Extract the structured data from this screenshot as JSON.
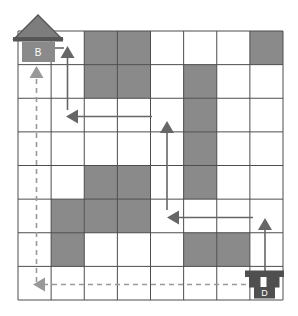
{
  "diagram": {
    "type": "grid-maze-path",
    "grid": {
      "x": 18,
      "y": 31,
      "width": 265,
      "height": 269,
      "cols": 8,
      "rows": 8,
      "line_color": "#4d4d4d",
      "blocked_fill": "#8a8a8a",
      "background": "#ffffff"
    },
    "blocked_cells": [
      {
        "col": 3,
        "row": 1
      },
      {
        "col": 4,
        "row": 1
      },
      {
        "col": 8,
        "row": 1
      },
      {
        "col": 3,
        "row": 2
      },
      {
        "col": 4,
        "row": 2
      },
      {
        "col": 6,
        "row": 2
      },
      {
        "col": 6,
        "row": 3
      },
      {
        "col": 6,
        "row": 4
      },
      {
        "col": 3,
        "row": 5
      },
      {
        "col": 4,
        "row": 5
      },
      {
        "col": 6,
        "row": 5
      },
      {
        "col": 2,
        "row": 6
      },
      {
        "col": 3,
        "row": 6
      },
      {
        "col": 4,
        "row": 6
      },
      {
        "col": 2,
        "row": 7
      },
      {
        "col": 6,
        "row": 7
      },
      {
        "col": 7,
        "row": 7
      }
    ],
    "solid_path": {
      "color": "#666666",
      "stroke_width": 1.6,
      "arrows": [
        {
          "x1": 67.5,
          "y1": 110,
          "x2": 67.5,
          "y2": 46,
          "head": true
        },
        {
          "x1": 152,
          "y1": 116.5,
          "x2": 66,
          "y2": 116.5,
          "head": true
        },
        {
          "x1": 167,
          "y1": 210,
          "x2": 167,
          "y2": 121,
          "head": true
        },
        {
          "x1": 253,
          "y1": 217.5,
          "x2": 167,
          "y2": 217.5,
          "head": true
        },
        {
          "x1": 265,
          "y1": 271,
          "x2": 265,
          "y2": 218,
          "head": true
        },
        {
          "x1": 64,
          "y1": 48,
          "x2": 55,
          "y2": 48,
          "head": false
        }
      ]
    },
    "dashed_path": {
      "color": "#999999",
      "stroke_width": 1.6,
      "dash": "5 4",
      "arrows": [
        {
          "x1": 246,
          "y1": 284.5,
          "x2": 33,
          "y2": 284.5,
          "head": true
        },
        {
          "x1": 36.5,
          "y1": 282,
          "x2": 36.5,
          "y2": 66,
          "head": true
        }
      ]
    },
    "house": {
      "label": "B",
      "roof_fill": "#7d7d7d",
      "trim_fill": "#565656",
      "body_fill": "#8a8a8a",
      "text_color": "#ffffff"
    },
    "truck": {
      "label": "D",
      "fill": "#4f4f4f",
      "text_color": "#ffffff"
    }
  }
}
